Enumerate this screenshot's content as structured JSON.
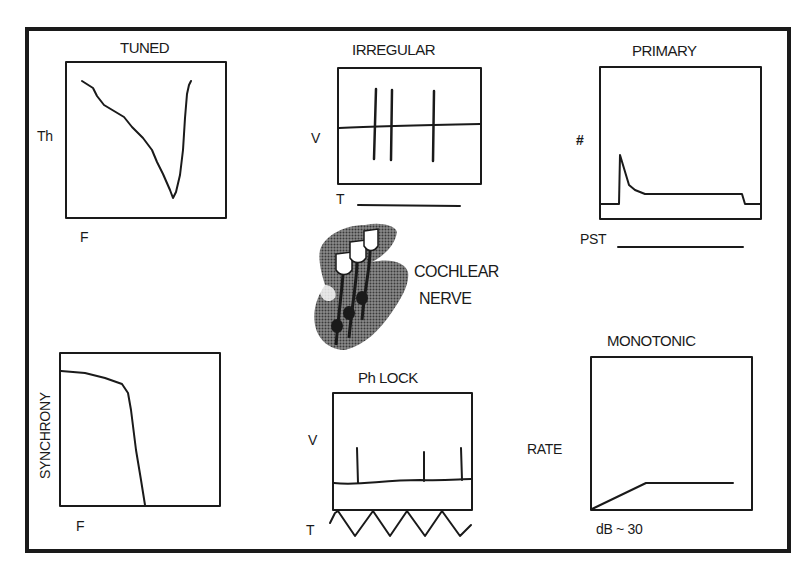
{
  "figure": {
    "panels": [
      {
        "id": "tuned",
        "title": "TUNED",
        "ylabel": "Th",
        "xlabel": "F"
      },
      {
        "id": "irregular",
        "title": "IRREGULAR",
        "ylabel": "V",
        "xlabel": "T"
      },
      {
        "id": "primary",
        "title": "PRIMARY",
        "ylabel": "#",
        "xlabel": "PST"
      },
      {
        "id": "synchrony",
        "title": "",
        "ylabel": "SYNCHRONY",
        "xlabel": "F"
      },
      {
        "id": "phlock",
        "title": "Ph LOCK",
        "ylabel": "V",
        "xlabel": "T"
      },
      {
        "id": "monotonic",
        "title": "MONOTONIC",
        "ylabel": "RATE",
        "xlabel": "dB ~ 30"
      }
    ],
    "center": {
      "line1": "COCHLEAR",
      "line2": "NERVE"
    }
  },
  "colors": {
    "ink": "#1a1a1a",
    "shade": "#555555",
    "background": "#ffffff"
  }
}
